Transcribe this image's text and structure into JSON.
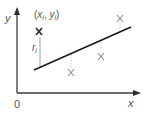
{
  "diagram": {
    "axes": {
      "x_label": "x",
      "y_label": "y",
      "origin_label": "0"
    },
    "point_label": {
      "open": "(",
      "x": "x",
      "x_sub": "i",
      "sep": ", ",
      "y": "y",
      "y_sub": "i",
      "close": ")"
    },
    "residual_label": {
      "r": "r",
      "sub": "i"
    },
    "marker_glyph": "X",
    "points": [
      {
        "id": "highlighted",
        "x": 39,
        "y": 31,
        "line_y": 62,
        "bold": true
      },
      {
        "id": "p2",
        "x": 71,
        "y": 72,
        "line_y": 54,
        "bold": false
      },
      {
        "id": "p3",
        "x": 101,
        "y": 56,
        "line_y": 41,
        "bold": false
      },
      {
        "id": "p4",
        "x": 120,
        "y": 18,
        "line_y": 32,
        "bold": false
      }
    ],
    "regression_line": {
      "x1": 34,
      "y1": 70,
      "x2": 131,
      "y2": 27
    },
    "colors": {
      "axis": "#3a3a3a",
      "line": "#1a1a1a",
      "marker": "#666666",
      "marker_bold": "#333333",
      "dotted": "#aaaaaa",
      "text": "#555555"
    }
  }
}
